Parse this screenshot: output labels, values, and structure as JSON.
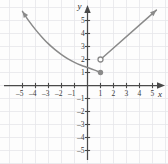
{
  "chart_data": {
    "type": "line",
    "title": "",
    "xlabel": "x",
    "ylabel": "y",
    "xlim": [
      -5.8,
      5.8
    ],
    "ylim": [
      -5.8,
      6.2
    ],
    "grid": true,
    "grid_step": 1,
    "legend": "none",
    "x_ticks": [
      -5,
      -4,
      -3,
      -2,
      -1,
      1,
      2,
      3,
      4,
      5
    ],
    "y_ticks": [
      5,
      4,
      3,
      2,
      1,
      -1,
      -2,
      -3,
      -4,
      -5
    ],
    "x_tick_labels": [
      "-5",
      "-4",
      "-3",
      "-2",
      "-1",
      "1",
      "2",
      "3",
      "4",
      "5"
    ],
    "y_tick_labels": [
      "5",
      "4",
      "3",
      "2",
      "1",
      "-1",
      "-2",
      "-3",
      "-4",
      "-5"
    ],
    "series": [
      {
        "name": "left-branch-curve",
        "style": "curve",
        "arrow_start": true,
        "arrow_end": false,
        "endpoint_marker": "closed",
        "points": [
          {
            "x": -5.0,
            "y": 5.7
          },
          {
            "x": -4.5,
            "y": 4.95
          },
          {
            "x": -4.0,
            "y": 4.3
          },
          {
            "x": -3.5,
            "y": 3.72
          },
          {
            "x": -3.0,
            "y": 3.2
          },
          {
            "x": -2.5,
            "y": 2.76
          },
          {
            "x": -2.0,
            "y": 2.38
          },
          {
            "x": -1.5,
            "y": 2.05
          },
          {
            "x": -1.0,
            "y": 1.78
          },
          {
            "x": -0.5,
            "y": 1.56
          },
          {
            "x": 0.0,
            "y": 1.38
          },
          {
            "x": 0.5,
            "y": 1.2
          },
          {
            "x": 1.0,
            "y": 1.0
          }
        ]
      },
      {
        "name": "right-branch-line",
        "style": "straight",
        "arrow_start": false,
        "arrow_end": true,
        "endpoint_marker": "open",
        "points": [
          {
            "x": 1.0,
            "y": 2.0
          },
          {
            "x": 5.3,
            "y": 5.8
          }
        ]
      }
    ],
    "markers": [
      {
        "name": "open-circle",
        "x": 1.0,
        "y": 2.0,
        "fill": "open"
      },
      {
        "name": "closed-circle",
        "x": 1.0,
        "y": 1.0,
        "fill": "closed"
      }
    ],
    "colors": {
      "curve": "#8a8a8a",
      "axis": "#4a4a4a",
      "grid": "#e6e6ea",
      "label": "#3a3a3a",
      "background": "#fdfdfd"
    }
  }
}
